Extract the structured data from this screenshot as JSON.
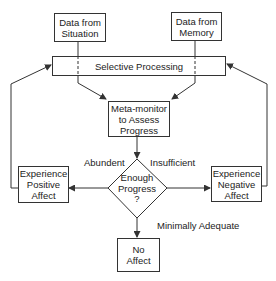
{
  "diagram": {
    "type": "flowchart",
    "nodes": {
      "situation": {
        "label": "Data from Situation",
        "line1": "Data from",
        "line2": "Situation"
      },
      "memory": {
        "label": "Data from Memory",
        "line1": "Data from",
        "line2": "Memory"
      },
      "selective": {
        "label": "Selective Processing"
      },
      "metamonitor": {
        "label": "Meta-monitor to Assess Progress",
        "line1": "Meta-monitor",
        "line2": "to Assess",
        "line3": "Progress"
      },
      "decision": {
        "label": "Enough Progress ?",
        "line1": "Enough",
        "line2": "Progress",
        "line3": "?"
      },
      "positive": {
        "label": "Experience Positive Affect",
        "line1": "Experience",
        "line2": "Positive",
        "line3": "Affect"
      },
      "negative": {
        "label": "Experience Negative Affect",
        "line1": "Experience",
        "line2": "Negative",
        "line3": "Affect"
      },
      "noaffect": {
        "label": "No Affect",
        "line1": "No",
        "line2": "Affect"
      }
    },
    "edge_labels": {
      "abundant": "Abundent",
      "insufficient": "Insufficient",
      "minimal": "Minimally Adequate"
    },
    "edges": [
      {
        "from": "situation",
        "to": "metamonitor",
        "via": "selective",
        "style": "dashed-through"
      },
      {
        "from": "memory",
        "to": "metamonitor",
        "via": "selective",
        "style": "dashed-through"
      },
      {
        "from": "metamonitor",
        "to": "decision"
      },
      {
        "from": "decision",
        "to": "positive",
        "label": "Abundent"
      },
      {
        "from": "decision",
        "to": "negative",
        "label": "Insufficient"
      },
      {
        "from": "decision",
        "to": "noaffect",
        "label": "Minimally Adequate"
      },
      {
        "from": "positive",
        "to": "selective",
        "style": "feedback"
      },
      {
        "from": "negative",
        "to": "selective",
        "style": "feedback"
      }
    ],
    "colors": {
      "line": "#333333",
      "text": "#222222",
      "background": "#ffffff"
    }
  }
}
